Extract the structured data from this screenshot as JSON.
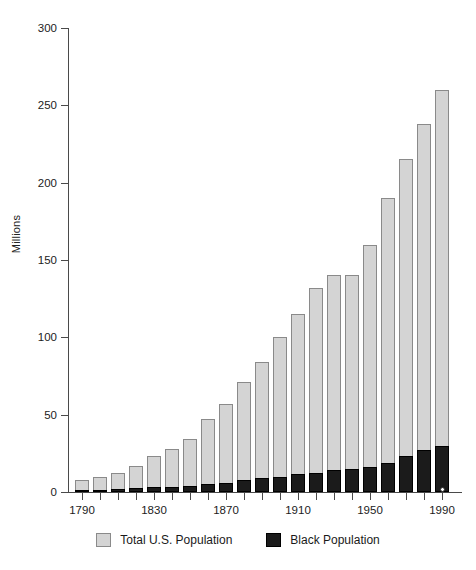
{
  "chart_data": {
    "type": "bar",
    "title": "",
    "xlabel": "",
    "ylabel": "Millions",
    "ylim": [
      0,
      300
    ],
    "yticks": [
      0,
      50,
      100,
      150,
      200,
      250,
      300
    ],
    "xtick_labels": [
      "1790",
      "1830",
      "1870",
      "1910",
      "1950",
      "1990"
    ],
    "grid": false,
    "legend_position": "bottom",
    "categories": [
      "1790",
      "1800",
      "1810",
      "1820",
      "1830",
      "1840",
      "1850",
      "1860",
      "1870",
      "1880",
      "1890",
      "1900",
      "1910",
      "1920",
      "1930",
      "1940",
      "1950",
      "1960",
      "1970",
      "1980",
      "1990"
    ],
    "series": [
      {
        "name": "Total U.S. Population",
        "color": "#d4d4d4",
        "values": [
          8,
          10,
          12,
          17,
          23,
          28,
          34,
          47,
          57,
          71,
          84,
          100,
          115,
          132,
          140,
          140,
          160,
          190,
          215,
          238,
          260
        ]
      },
      {
        "name": "Black Population",
        "color": "#1b1b1b",
        "values": [
          1,
          1.5,
          2,
          2.5,
          3,
          3.5,
          4,
          5,
          6,
          7.5,
          9,
          10,
          11.5,
          12.5,
          14,
          15,
          16,
          19,
          23,
          27,
          30
        ]
      }
    ],
    "annotation_marker": {
      "category": "1990",
      "shape": "open-circle",
      "value": 0
    }
  },
  "legend": {
    "items": [
      {
        "label": "Total U.S. Population",
        "swatch": "light-gray-swatch"
      },
      {
        "label": "Black Population",
        "swatch": "black-swatch"
      }
    ]
  }
}
